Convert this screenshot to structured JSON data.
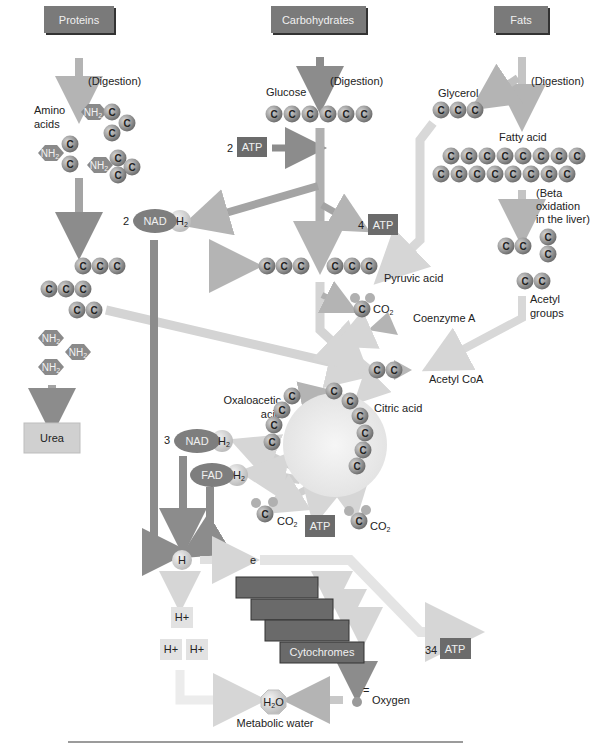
{
  "colors": {
    "dark_box": "#6b6b6b",
    "mid_gray": "#8a8a8a",
    "light_gray": "#d8d8d8",
    "arrow_dark": "#8c8c8c",
    "arrow_light": "#d9d9d9",
    "carbon_ball": "#9a9a9a",
    "cycle_fill": "#ececec",
    "urea_box": "#d0d0d0"
  },
  "sources": {
    "proteins": "Proteins",
    "carbohydrates": "Carbohydrates",
    "fats": "Fats"
  },
  "digestion": "(Digestion)",
  "protein_branch": {
    "amino_acids_line1": "Amino",
    "amino_acids_line2": "acids",
    "amine_group": "NH",
    "amine_sub": "2",
    "urea": "Urea"
  },
  "carb_branch": {
    "glucose": "Glucose",
    "atp_in_count": "2",
    "atp_label": "ATP",
    "atp_out_count": "4",
    "nad_count": "2",
    "nad": "NAD",
    "h2": "H",
    "h2_sub": "2"
  },
  "fat_branch": {
    "glycerol": "Glycerol",
    "fatty_acid": "Fatty acid",
    "beta_line1": "(Beta",
    "beta_line2": "oxidation",
    "beta_line3": "in the liver)",
    "acetyl_line1": "Acetyl",
    "acetyl_line2": "groups"
  },
  "pyruvate": {
    "pyruvic_acid": "Pyruvic acid",
    "co2": "CO",
    "co2_sub": "2",
    "coenzyme_a": "Coenzyme A",
    "acetyl_coa": "Acetyl CoA"
  },
  "krebs": {
    "oxaloacetic_line1": "Oxaloacetic",
    "oxaloacetic_line2": "acid",
    "citric_acid": "Citric acid",
    "nad_count": "3",
    "nad": "NAD",
    "fad": "FAD",
    "h2": "H",
    "h2_sub": "2",
    "atp": "ATP",
    "co2": "CO",
    "co2_sub": "2"
  },
  "electron_transport": {
    "hydrogen": "H",
    "electron": "e",
    "h_plus": "H+",
    "cytochromes": "Cytochromes",
    "atp_count": "34",
    "atp": "ATP",
    "oxygen_charge": "=",
    "oxygen": "Oxygen",
    "water": "H",
    "water_sub": "2",
    "water_o": "O",
    "metabolic_water": "Metabolic water"
  },
  "carbon": "C"
}
